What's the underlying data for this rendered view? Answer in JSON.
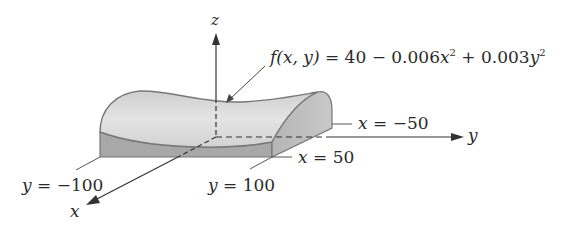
{
  "diagram": {
    "axes": {
      "z": "z",
      "y": "y",
      "x": "x"
    },
    "formula": {
      "lhs": "f(x, y)",
      "eq": " = 40 − 0.006",
      "var1": "x",
      "exp1": "2",
      "plus": " + 0.003",
      "var2": "y",
      "exp2": "2"
    },
    "boundaries": {
      "x_neg": {
        "var": "x",
        "text": " = −50"
      },
      "x_pos": {
        "var": "x",
        "text": " = 50"
      },
      "y_neg": {
        "var": "y",
        "text": " = −100"
      },
      "y_pos": {
        "var": "y",
        "text": " = 100"
      }
    },
    "colors": {
      "surface_light": "#d8d8d8",
      "surface_mid": "#c4c4c4",
      "side_face": "#a9a9a9",
      "end_face": "#bdbdbd",
      "outline": "#777777",
      "axis": "#333333"
    }
  }
}
